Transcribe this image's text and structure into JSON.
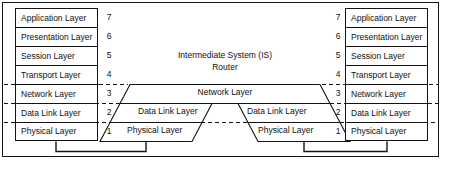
{
  "diagram": {
    "colors": {
      "line": "#141414",
      "background": "#ffffff",
      "text": "#111111"
    }
  },
  "left_stack": {
    "label": "End System layers (left)",
    "layers": [
      {
        "number": "7",
        "name": "Application Layer"
      },
      {
        "number": "6",
        "name": "Presentation Layer"
      },
      {
        "number": "5",
        "name": "Session Layer"
      },
      {
        "number": "4",
        "name": "Transport Layer"
      },
      {
        "number": "3",
        "name": "Network Layer"
      },
      {
        "number": "2",
        "name": "Data Link Layer"
      },
      {
        "number": "1",
        "name": "Physical Layer"
      }
    ]
  },
  "right_stack": {
    "label": "End System layers (right)",
    "layers": [
      {
        "number": "7",
        "name": "Application Layer"
      },
      {
        "number": "6",
        "name": "Presentation Layer"
      },
      {
        "number": "5",
        "name": "Session Layer"
      },
      {
        "number": "4",
        "name": "Transport Layer"
      },
      {
        "number": "3",
        "name": "Network Layer"
      },
      {
        "number": "2",
        "name": "Data Link Layer"
      },
      {
        "number": "1",
        "name": "Physical Layer"
      }
    ]
  },
  "intermediate_system": {
    "caption_line1": "Intermediate System (IS)",
    "caption_line2": "Router",
    "network_layer": "Network Layer",
    "data_link_left": "Data Link Layer",
    "data_link_right": "Data Link Layer",
    "physical_left": "Physical Layer",
    "physical_right": "Physical Layer"
  }
}
